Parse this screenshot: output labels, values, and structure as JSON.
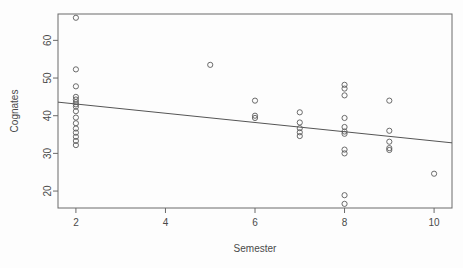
{
  "chart_data": {
    "type": "scatter",
    "title": "",
    "xlabel": "Semester",
    "ylabel": "Cognates",
    "xlim": [
      1.6,
      10.4
    ],
    "ylim": [
      15.5,
      67.0
    ],
    "grid": false,
    "legend": null,
    "xticks": [
      2,
      4,
      6,
      8,
      10
    ],
    "xtick_labels": [
      "2",
      "4",
      "6",
      "8",
      "10"
    ],
    "yticks": [
      20,
      30,
      40,
      50,
      60
    ],
    "ytick_labels": [
      "20",
      "30",
      "40",
      "50",
      "60"
    ],
    "marker": "open-circle",
    "marker_color": "#5b5b5b",
    "points": [
      {
        "x": 2,
        "y": 66.0
      },
      {
        "x": 2,
        "y": 52.3
      },
      {
        "x": 2,
        "y": 47.8
      },
      {
        "x": 2,
        "y": 45.0
      },
      {
        "x": 2,
        "y": 44.3
      },
      {
        "x": 2,
        "y": 43.6
      },
      {
        "x": 2,
        "y": 43.0
      },
      {
        "x": 2,
        "y": 42.4
      },
      {
        "x": 2,
        "y": 41.2
      },
      {
        "x": 2,
        "y": 39.5
      },
      {
        "x": 2,
        "y": 38.0
      },
      {
        "x": 2,
        "y": 36.6
      },
      {
        "x": 2,
        "y": 35.5
      },
      {
        "x": 2,
        "y": 34.4
      },
      {
        "x": 2,
        "y": 33.3
      },
      {
        "x": 2,
        "y": 32.2
      },
      {
        "x": 5,
        "y": 53.5
      },
      {
        "x": 6,
        "y": 44.0
      },
      {
        "x": 6,
        "y": 40.0
      },
      {
        "x": 6,
        "y": 39.4
      },
      {
        "x": 7,
        "y": 40.9
      },
      {
        "x": 7,
        "y": 38.2
      },
      {
        "x": 7,
        "y": 36.7
      },
      {
        "x": 7,
        "y": 35.6
      },
      {
        "x": 7,
        "y": 34.6
      },
      {
        "x": 8,
        "y": 48.2
      },
      {
        "x": 8,
        "y": 47.2
      },
      {
        "x": 8,
        "y": 45.4
      },
      {
        "x": 8,
        "y": 39.4
      },
      {
        "x": 8,
        "y": 37.0
      },
      {
        "x": 8,
        "y": 35.8
      },
      {
        "x": 8,
        "y": 35.2
      },
      {
        "x": 8,
        "y": 31.0
      },
      {
        "x": 8,
        "y": 30.0
      },
      {
        "x": 8,
        "y": 18.9
      },
      {
        "x": 8,
        "y": 16.6
      },
      {
        "x": 9,
        "y": 44.0
      },
      {
        "x": 9,
        "y": 36.0
      },
      {
        "x": 9,
        "y": 33.1
      },
      {
        "x": 9,
        "y": 31.4
      },
      {
        "x": 9,
        "y": 30.9
      },
      {
        "x": 10,
        "y": 24.6
      }
    ],
    "fit_line": {
      "name": "linear-regression",
      "x_start": 1.6,
      "y_start": 43.6,
      "x_end": 10.4,
      "y_end": 32.8,
      "color": "#555555"
    }
  }
}
